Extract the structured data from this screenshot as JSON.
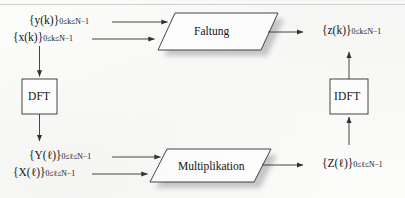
{
  "diagram": {
    "language": "de",
    "colors": {
      "background": "#fbfbfa",
      "stroke": "#303030",
      "text": "#141414",
      "shadow": "#b0b0b0",
      "shape_fill": "#ffffff"
    },
    "signals": {
      "y_time": {
        "set": "{y(k)}",
        "range": "0≤k≤N−1"
      },
      "x_time": {
        "set": "{x(k)}",
        "range": "0≤k≤N−1"
      },
      "z_time": {
        "set": "{z(k)}",
        "range": "0≤k≤N−1"
      },
      "Y_freq": {
        "set": "{Y(ℓ)}",
        "range": "0≤ℓ≤N−1"
      },
      "X_freq": {
        "set": "{X(ℓ)}",
        "range": "0≤ℓ≤N−1"
      },
      "Z_freq": {
        "set": "{Z(ℓ)}",
        "range": "0≤ℓ≤N−1"
      }
    },
    "labels": {
      "y_time_main": "{y(k)}",
      "y_time_sub": "0≤k≤N−1",
      "x_time_main": "{x(k)}",
      "x_time_sub": "0≤k≤N−1",
      "z_time_main": "{z(k)}",
      "z_time_sub": "0≤k≤N−1",
      "Y_freq_main": "{Y(ℓ)}",
      "Y_freq_sub": "0≤ℓ≤N−1",
      "X_freq_main": "{X(ℓ)}",
      "X_freq_sub": "0≤ℓ≤N−1",
      "Z_freq_main": "{Z(ℓ)}",
      "Z_freq_sub": "0≤ℓ≤N−1"
    },
    "operations": {
      "convolution": "Faltung",
      "multiplication": "Multiplikation"
    },
    "transforms": {
      "forward": "DFT",
      "inverse": "IDFT"
    }
  }
}
